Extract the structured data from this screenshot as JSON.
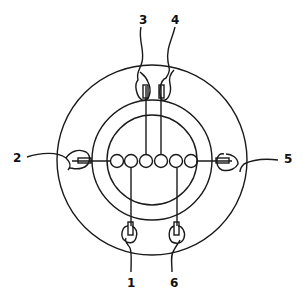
{
  "diagram": {
    "type": "circular wiring/terminal diagram",
    "stroke_color": "#1a1a1a",
    "background": "#ffffff",
    "labels": [
      {
        "id": "1",
        "text": "1",
        "x": 127,
        "y": 283
      },
      {
        "id": "2",
        "text": "2",
        "x": 14,
        "y": 152
      },
      {
        "id": "3",
        "text": "3",
        "x": 139,
        "y": 14
      },
      {
        "id": "4",
        "text": "4",
        "x": 170,
        "y": 14
      },
      {
        "id": "5",
        "text": "5",
        "x": 283,
        "y": 152
      },
      {
        "id": "6",
        "text": "6",
        "x": 172,
        "y": 283
      }
    ],
    "circles": {
      "outer": {
        "cx": 152,
        "cy": 160,
        "r": 95
      },
      "middle": {
        "cx": 152,
        "cy": 160,
        "r": 60
      },
      "inner": {
        "cx": 152,
        "cy": 160,
        "r": 45
      }
    },
    "contacts": {
      "count": 6,
      "cy": 161,
      "r": 6.5,
      "cx": [
        117,
        131,
        146,
        161,
        176,
        191
      ]
    }
  }
}
